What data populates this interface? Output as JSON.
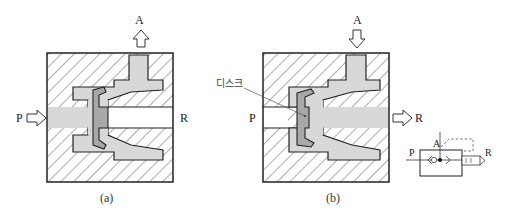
{
  "figure": {
    "panel_a": {
      "caption": "(a)",
      "labels": {
        "port_a": "A",
        "port_p": "P",
        "port_r": "R"
      },
      "flow": "P → A (A arrow upward), R blocked"
    },
    "panel_b": {
      "caption": "(b)",
      "labels": {
        "port_a": "A",
        "port_p": "P",
        "port_r": "R",
        "disc": "디스크"
      },
      "flow": "A → R (A arrow downward), P blocked"
    },
    "symbol": {
      "labels": {
        "port_p": "P",
        "port_a": "A",
        "port_r": "R"
      }
    },
    "colors": {
      "body_outline": "#222222",
      "channel_fill": "#d8d8d8",
      "disc_fill": "#a8a8a8",
      "hatch": "#333333"
    }
  }
}
